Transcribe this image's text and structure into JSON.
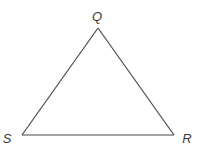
{
  "diagram": {
    "type": "triangle",
    "vertices": [
      {
        "id": "Q",
        "label": "Q",
        "x": 98,
        "y": 28,
        "label_x": 97,
        "label_y": 21
      },
      {
        "id": "S",
        "label": "S",
        "x": 22,
        "y": 135,
        "label_x": 7,
        "label_y": 143
      },
      {
        "id": "R",
        "label": "R",
        "x": 174,
        "y": 135,
        "label_x": 187,
        "label_y": 143
      }
    ],
    "edges": [
      {
        "from": "Q",
        "to": "R"
      },
      {
        "from": "R",
        "to": "S"
      },
      {
        "from": "S",
        "to": "Q"
      }
    ],
    "colors": {
      "stroke": "#4a4a4a",
      "label": "#3a3a3a",
      "background": "#ffffff"
    }
  }
}
